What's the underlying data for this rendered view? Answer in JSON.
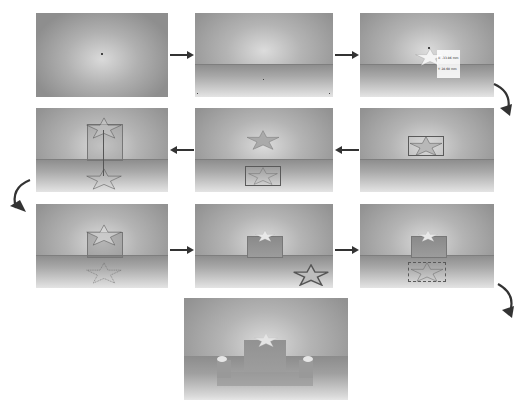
{
  "colors": {
    "panel_edge": "#8e8e8e",
    "panel_center": "#dcdcdc",
    "floor_light": "#e4e4e4",
    "arrow": "#333333",
    "outline": "#5a5a5a"
  },
  "steps": [
    {
      "id": 1,
      "row": 1,
      "col": 1,
      "description": "Empty viewport with center point"
    },
    {
      "id": 2,
      "row": 1,
      "col": 2,
      "description": "Ground plane added with horizon"
    },
    {
      "id": 3,
      "row": 1,
      "col": 3,
      "description": "Star shape drawn with coordinate tooltip",
      "tooltip": {
        "x_label": "X: -33.86 mm",
        "y_label": "Y: 28.60 mm"
      }
    },
    {
      "id": 4,
      "row": 2,
      "col": 3,
      "description": "Star selected with bounding box"
    },
    {
      "id": 5,
      "row": 2,
      "col": 2,
      "description": "Star shape copied to floor plane"
    },
    {
      "id": 6,
      "row": 2,
      "col": 1,
      "description": "Star extruded with vertical guide"
    },
    {
      "id": 7,
      "row": 3,
      "col": 1,
      "description": "Extruded star with floor projection"
    },
    {
      "id": 8,
      "row": 3,
      "col": 2,
      "description": "Rendered extrusion with preview thumbnail"
    },
    {
      "id": 9,
      "row": 3,
      "col": 3,
      "description": "Extrusion with floor outline"
    },
    {
      "id": 10,
      "row": 4,
      "col": 2,
      "description": "Final scene with three extruded objects"
    }
  ],
  "flow": [
    {
      "from": 1,
      "to": 2,
      "direction": "right"
    },
    {
      "from": 2,
      "to": 3,
      "direction": "right"
    },
    {
      "from": 3,
      "to": 4,
      "direction": "curve-down"
    },
    {
      "from": 4,
      "to": 5,
      "direction": "left"
    },
    {
      "from": 5,
      "to": 6,
      "direction": "left"
    },
    {
      "from": 6,
      "to": 7,
      "direction": "curve-down"
    },
    {
      "from": 7,
      "to": 8,
      "direction": "right"
    },
    {
      "from": 8,
      "to": 9,
      "direction": "right"
    },
    {
      "from": 9,
      "to": 10,
      "direction": "curve-down"
    }
  ]
}
